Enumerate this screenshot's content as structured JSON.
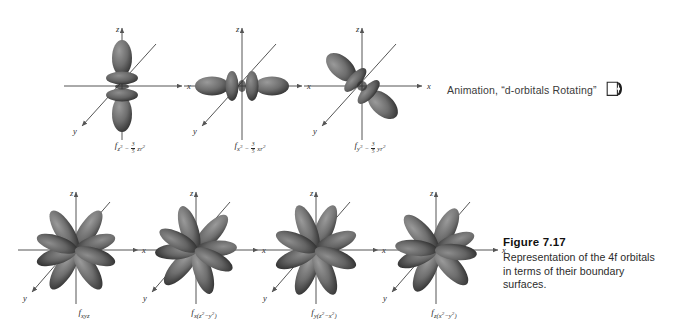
{
  "page": {
    "background": "#ffffff",
    "ink": "#2a2a2a",
    "lobe_color": "#6e6e6e",
    "lobe_shadow": "#3c3c3c"
  },
  "axis_labels": {
    "x": "x",
    "y": "y",
    "z": "z"
  },
  "animation": {
    "text": "Animation, “d-orbitals Rotating”",
    "icon": "cd-media-icon"
  },
  "figure": {
    "number": "Figure 7.17",
    "caption_line1": "Representation of the 4f orbitals",
    "caption_line2": "in terms of their boundary",
    "caption_line3": "surfaces.",
    "caption_full": "Representation of the 4f orbitals in terms of their boundary surfaces."
  },
  "orbitals": {
    "top_row": [
      {
        "id": "fz3",
        "base": "z",
        "base_exp": "3",
        "coef_num": "3",
        "coef_den": "5",
        "term": "zr",
        "term_exp": "2",
        "label_plain": "f z³ − 3/5 zr²",
        "shape": "two-z-lobes-with-two-tori"
      },
      {
        "id": "fx3",
        "base": "x",
        "base_exp": "3",
        "coef_num": "3",
        "coef_den": "5",
        "term": "xr",
        "term_exp": "2",
        "label_plain": "f x³ − 3/5 xr²",
        "shape": "two-x-lobes-with-two-tori"
      },
      {
        "id": "fy3",
        "base": "y",
        "base_exp": "3",
        "coef_num": "3",
        "coef_den": "5",
        "term": "yr",
        "term_exp": "2",
        "label_plain": "f y³ − 3/5 yr²",
        "shape": "two-y-lobes-with-two-tori"
      }
    ],
    "bottom_row": [
      {
        "id": "fxyz",
        "label_plain": "f xyz",
        "sub": "xyz",
        "shape": "eight-lobe-cubic"
      },
      {
        "id": "fxz2y2",
        "label_plain": "f x(z²−y²)",
        "sub": "x(z2−y2)",
        "shape": "eight-lobe-cubic"
      },
      {
        "id": "fyz2x2",
        "label_plain": "f y(z²−x²)",
        "sub": "y(z2−x2)",
        "shape": "eight-lobe-cubic"
      },
      {
        "id": "fzx2y2",
        "label_plain": "f z(x²−y²)",
        "sub": "z(x2−y2)",
        "shape": "eight-lobe-cubic"
      }
    ]
  }
}
